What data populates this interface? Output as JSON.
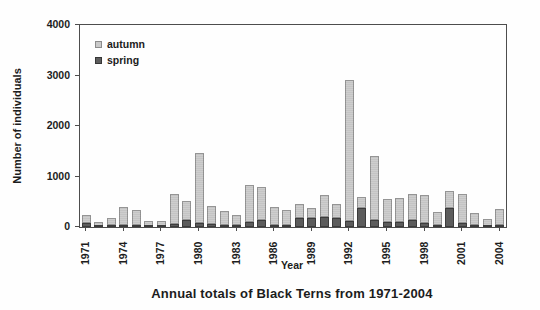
{
  "figure": {
    "caption": "Annual totals of Black Terns from 1971-2004"
  },
  "chart_data": {
    "type": "bar",
    "stacked": true,
    "title": "Annual totals of Black Terns from 1971-2004",
    "xlabel": "Year",
    "ylabel": "Number of individuals",
    "ylim": [
      0,
      4000
    ],
    "y_ticks": [
      0,
      1000,
      2000,
      3000,
      4000
    ],
    "x_tick_labels": [
      "1971",
      "1974",
      "1977",
      "1980",
      "1983",
      "1986",
      "1989",
      "1992",
      "1995",
      "1998",
      "2001",
      "2004"
    ],
    "categories": [
      1971,
      1972,
      1973,
      1974,
      1975,
      1976,
      1977,
      1978,
      1979,
      1980,
      1981,
      1982,
      1983,
      1984,
      1985,
      1986,
      1987,
      1988,
      1989,
      1990,
      1991,
      1992,
      1993,
      1994,
      1995,
      1996,
      1997,
      1998,
      1999,
      2000,
      2001,
      2002,
      2003,
      2004
    ],
    "series": [
      {
        "name": "spring",
        "color": "#5c5c5c",
        "stack_order": "bottom",
        "values": [
          80,
          20,
          30,
          40,
          40,
          20,
          25,
          50,
          140,
          70,
          60,
          30,
          40,
          90,
          130,
          35,
          30,
          180,
          180,
          190,
          170,
          120,
          380,
          130,
          100,
          90,
          130,
          70,
          30,
          380,
          70,
          40,
          25,
          30
        ]
      },
      {
        "name": "autumn",
        "color": "#c9c9c9",
        "stack_order": "top",
        "values": [
          150,
          80,
          130,
          350,
          290,
          90,
          95,
          590,
          370,
          1380,
          360,
          270,
          200,
          730,
          650,
          355,
          300,
          270,
          200,
          440,
          280,
          2790,
          215,
          1270,
          460,
          470,
          510,
          550,
          250,
          330,
          570,
          240,
          145,
          320
        ]
      }
    ],
    "legend": {
      "position": "top-left",
      "entries": [
        {
          "label": "autumn",
          "color": "#c9c9c9"
        },
        {
          "label": "spring",
          "color": "#5c5c5c"
        }
      ]
    },
    "grid": "off"
  }
}
